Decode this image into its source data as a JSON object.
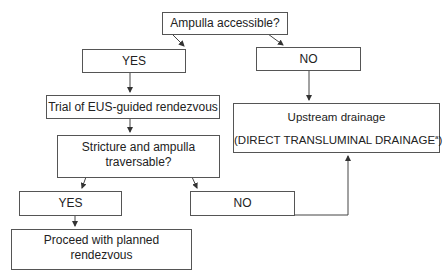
{
  "flowchart": {
    "nodes": {
      "ampulla_q": {
        "label": "Ampulla accessible?"
      },
      "yes1": {
        "label": "YES"
      },
      "no1": {
        "label": "NO"
      },
      "trial": {
        "label": "Trial of EUS-guided rendezvous"
      },
      "upstream": {
        "title": "Upstream drainage",
        "subtitle_main": "(DIRECT TRANSLUMINAL DRAINAGE",
        "subtitle_sup": "a",
        "subtitle_end": ")"
      },
      "stricture_q": {
        "line1": "Stricture and ampulla",
        "line2": "traversable?"
      },
      "yes2": {
        "label": "YES"
      },
      "no2": {
        "label": "NO"
      },
      "proceed": {
        "label": "Proceed with planned rendezvous"
      }
    },
    "edges": [
      {
        "from": "ampulla_q",
        "to": "yes1"
      },
      {
        "from": "ampulla_q",
        "to": "no1"
      },
      {
        "from": "yes1",
        "to": "trial"
      },
      {
        "from": "no1",
        "to": "upstream"
      },
      {
        "from": "trial",
        "to": "stricture_q"
      },
      {
        "from": "stricture_q",
        "to": "yes2"
      },
      {
        "from": "stricture_q",
        "to": "no2"
      },
      {
        "from": "yes2",
        "to": "proceed"
      },
      {
        "from": "no2",
        "to": "upstream"
      }
    ],
    "colors": {
      "line": "#555555",
      "text": "#222222",
      "background": "#ffffff"
    }
  }
}
